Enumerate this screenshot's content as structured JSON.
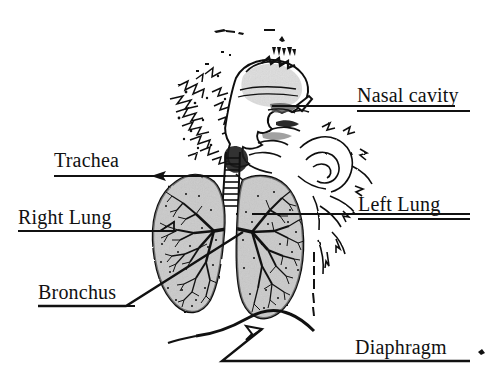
{
  "document": {
    "title": "Respiratory System Diagram",
    "kind": "scanned-anatomical-illustration",
    "background_color": "#ffffff",
    "ink_color": "#000000",
    "lung_fill_color": "#d8d8d8"
  },
  "labels": {
    "nasal_cavity": "Nasal cavity",
    "trachea": "Trachea",
    "right_lung": "Right Lung",
    "left_lung": "Left Lung",
    "bronchus": "Bronchus",
    "diaphragm": "Diaphragm"
  },
  "structures": [
    {
      "name": "head-sagittal-section"
    },
    {
      "name": "nasal-cavity"
    },
    {
      "name": "trachea"
    },
    {
      "name": "right-lung"
    },
    {
      "name": "left-lung"
    },
    {
      "name": "bronchus"
    },
    {
      "name": "diaphragm"
    },
    {
      "name": "shoulder-outline"
    }
  ]
}
